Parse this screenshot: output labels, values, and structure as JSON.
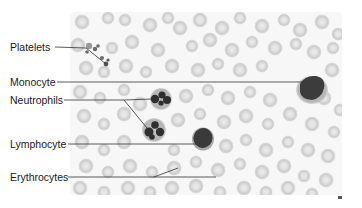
{
  "figure": {
    "type": "labeled-micrograph",
    "labels": [
      {
        "id": "platelets",
        "text": "Platelets",
        "x": 10,
        "y": 41
      },
      {
        "id": "monocyte",
        "text": "Monocyte",
        "x": 10,
        "y": 76
      },
      {
        "id": "neutrophils",
        "text": "Neutrophils",
        "x": 10,
        "y": 94
      },
      {
        "id": "lymphocyte",
        "text": "Lymphocyte",
        "x": 10,
        "y": 138
      },
      {
        "id": "erythrocytes",
        "text": "Erythrocytes",
        "x": 10,
        "y": 172
      }
    ],
    "credit_mark": "M"
  },
  "colors": {
    "background": "#ffffff",
    "rbc_fill": "#d2d2d2",
    "rbc_center": "#e8e8e8",
    "nucleus": "#3a3a3a",
    "wbc_cytoplasm": "#bdbdbd",
    "leader_line": "#333333",
    "text": "#1a1a1a"
  }
}
